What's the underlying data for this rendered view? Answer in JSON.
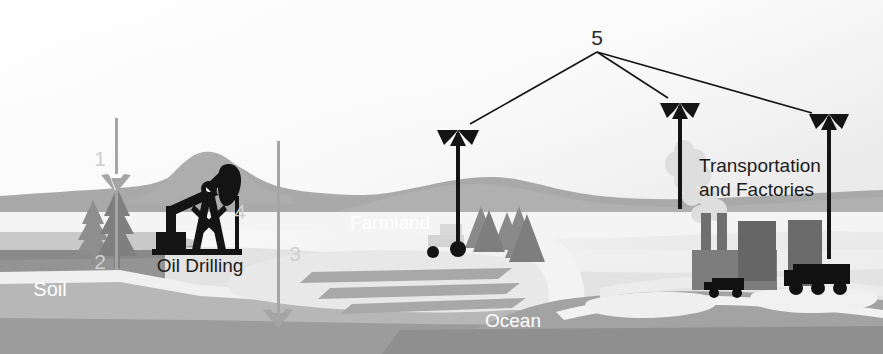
{
  "diagram": {
    "title_visible": false,
    "type": "carbon-cycle-landscape-illustration",
    "labels": {
      "soil": "Soil",
      "oil_drilling": "Oil Drilling",
      "farmland": "Farmland",
      "ocean": "Ocean",
      "transportation_and_factories_line1": "Transportation",
      "transportation_and_factories_line2": "and Factories"
    },
    "callout_numbers": {
      "one": "1",
      "two": "2",
      "three": "3",
      "four": "4",
      "five": "5"
    },
    "colors": {
      "sky_top": "#fdfdfd",
      "sky_bottom": "#f2f2f2",
      "far_hill": "#a9a9a9",
      "mid_hill": "#b4b4b4",
      "light_field": "#e8e8e8",
      "pale_field": "#f3f3f3",
      "soil_dark": "#8e8e8e",
      "soil_mid": "#9e9e9e",
      "soil_pale": "#d7d7d7",
      "ocean": "#a3a3a3",
      "ocean_deep": "#8f8f8f",
      "tree": "#8a8a8a",
      "silhouette": "#141414",
      "factory_dark": "#6f6f6f",
      "factory_mid": "#7d7d7d",
      "smoke": "#dcdcdc",
      "pole_grey": "#a0a0a0",
      "pole_black": "#141414",
      "number_grey": "#cfcfcf"
    },
    "elements": [
      {
        "name": "downward-arrow-1",
        "direction": "down",
        "color": "#a0a0a0",
        "meaning": "carbon flow into soil/vegetation"
      },
      {
        "name": "upward-arrow-2",
        "direction": "up",
        "color": "#a0a0a0",
        "meaning": "carbon flow out of soil"
      },
      {
        "name": "downward-arrow-3",
        "direction": "down",
        "color": "#a0a0a0",
        "meaning": "carbon flow into deep ground"
      },
      {
        "name": "oil-rig-4",
        "direction": "static",
        "color": "#141414",
        "meaning": "fossil fuel extraction"
      },
      {
        "name": "upward-arrows-5",
        "direction": "up",
        "color": "#141414",
        "meaning": "emissions to atmosphere"
      }
    ]
  }
}
